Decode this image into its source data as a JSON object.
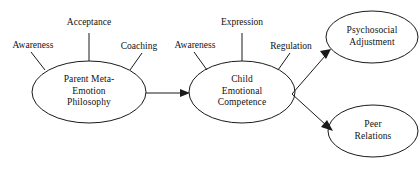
{
  "diagram": {
    "type": "path-model",
    "title": "",
    "nodes": [
      {
        "id": "parent-meta-emotion-philosophy",
        "lines": [
          "Parent Meta-",
          "Emotion",
          "Philosophy"
        ],
        "shape": "ellipse",
        "cx": 89,
        "cy": 92,
        "rx": 57,
        "ry": 31
      },
      {
        "id": "child-emotional-competence",
        "lines": [
          "Child",
          "Emotional",
          "Competence"
        ],
        "shape": "ellipse",
        "cx": 242,
        "cy": 92,
        "rx": 53,
        "ry": 31
      },
      {
        "id": "psychosocial-adjustment",
        "lines": [
          "Psychosocial",
          "Adjustment"
        ],
        "shape": "ellipse",
        "cx": 372,
        "cy": 37,
        "rx": 46,
        "ry": 26
      },
      {
        "id": "peer-relations",
        "lines": [
          "Peer",
          "Relations"
        ],
        "shape": "ellipse",
        "cx": 373,
        "cy": 131,
        "rx": 45,
        "ry": 26
      }
    ],
    "indicators": [
      {
        "id": "parent-awareness",
        "label": "Awareness",
        "parent": "parent-meta-emotion-philosophy"
      },
      {
        "id": "parent-acceptance",
        "label": "Acceptance",
        "parent": "parent-meta-emotion-philosophy"
      },
      {
        "id": "parent-coaching",
        "label": "Coaching",
        "parent": "parent-meta-emotion-philosophy"
      },
      {
        "id": "child-awareness",
        "label": "Awareness",
        "parent": "child-emotional-competence"
      },
      {
        "id": "child-expression",
        "label": "Expression",
        "parent": "child-emotional-competence"
      },
      {
        "id": "child-regulation",
        "label": "Regulation",
        "parent": "child-emotional-competence"
      }
    ],
    "arrows": [
      {
        "id": "parent-to-child",
        "from": "parent-meta-emotion-philosophy",
        "to": "child-emotional-competence",
        "label": ""
      },
      {
        "id": "child-to-psychosocial",
        "from": "child-emotional-competence",
        "to": "psychosocial-adjustment",
        "label": ""
      },
      {
        "id": "child-to-peer",
        "from": "child-emotional-competence",
        "to": "peer-relations",
        "label": ""
      }
    ],
    "colors": {
      "stroke": "#1a1a1a",
      "fill": "#ffffff",
      "text": "#111111",
      "background": "#ffffff"
    }
  }
}
